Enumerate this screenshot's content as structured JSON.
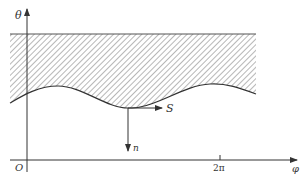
{
  "diagram": {
    "type": "coordinate-diagram",
    "axes": {
      "vertical": {
        "label": "θ"
      },
      "horizontal": {
        "label": "φ"
      },
      "origin_label": "O",
      "ticks": [
        {
          "label": "2π"
        }
      ]
    },
    "vectors": [
      {
        "name": "normal",
        "label": "n",
        "direction": "down"
      },
      {
        "name": "tangent",
        "label": "S",
        "direction": "right"
      }
    ],
    "region": {
      "fill": "hatched",
      "upper_boundary": "straight line",
      "lower_boundary": "wavy curve"
    },
    "colors": {
      "line": "#333333",
      "hatch": "#7a7a7a",
      "background": "#ffffff"
    }
  }
}
